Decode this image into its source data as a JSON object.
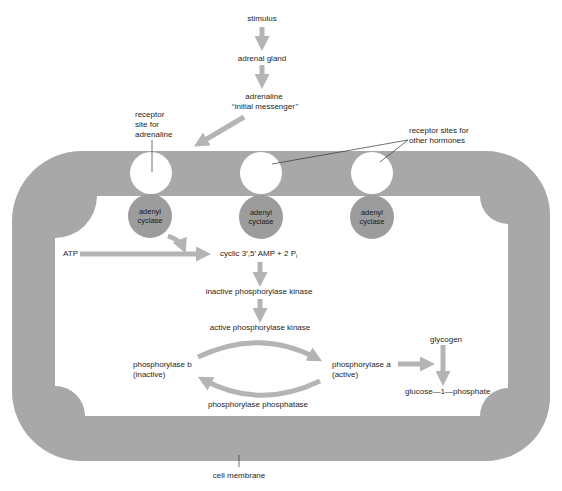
{
  "colors": {
    "membrane": "#a8a8a8",
    "arrow": "#b4b4b4",
    "enzyme": "#9c9c9c",
    "receptor": "#ffffff",
    "text": "#1e1e1e"
  },
  "top_chain": {
    "stimulus": "stimulus",
    "adrenal_gland": "adrenal gland",
    "adrenaline": "adrenaline",
    "initial_messenger": "‘‘initial messenger’’"
  },
  "labels": {
    "receptor_adrenaline": [
      "receptor",
      "site for",
      "adrenaline"
    ],
    "receptor_other": [
      "receptor sites for",
      "other hormones"
    ],
    "cell_membrane": "cell membrane"
  },
  "enzymes": [
    {
      "line1": "adenyl",
      "line2": "cyclase"
    },
    {
      "line1": "adenyl",
      "line2": "cyclase"
    },
    {
      "line1": "adenyl",
      "line2": "cyclase"
    }
  ],
  "pathway": {
    "atp": "ATP",
    "cyclic_amp": "cyclic 3′,5′ AMP + 2 P",
    "cyclic_amp_sub": "i",
    "inactive_kinase": "inactive phosphorylase kinase",
    "active_kinase": "active phosphorylase kinase",
    "phosphorylase_b": "phosphorylase b",
    "phosphorylase_b_state": "(inactive)",
    "phosphorylase_a": "phosphorylase a",
    "phosphorylase_a_state": "(active)",
    "phosphatase": "phosphorylase phosphatase",
    "glycogen": "glycogen",
    "g1p": "glucose—1—phosphate"
  }
}
